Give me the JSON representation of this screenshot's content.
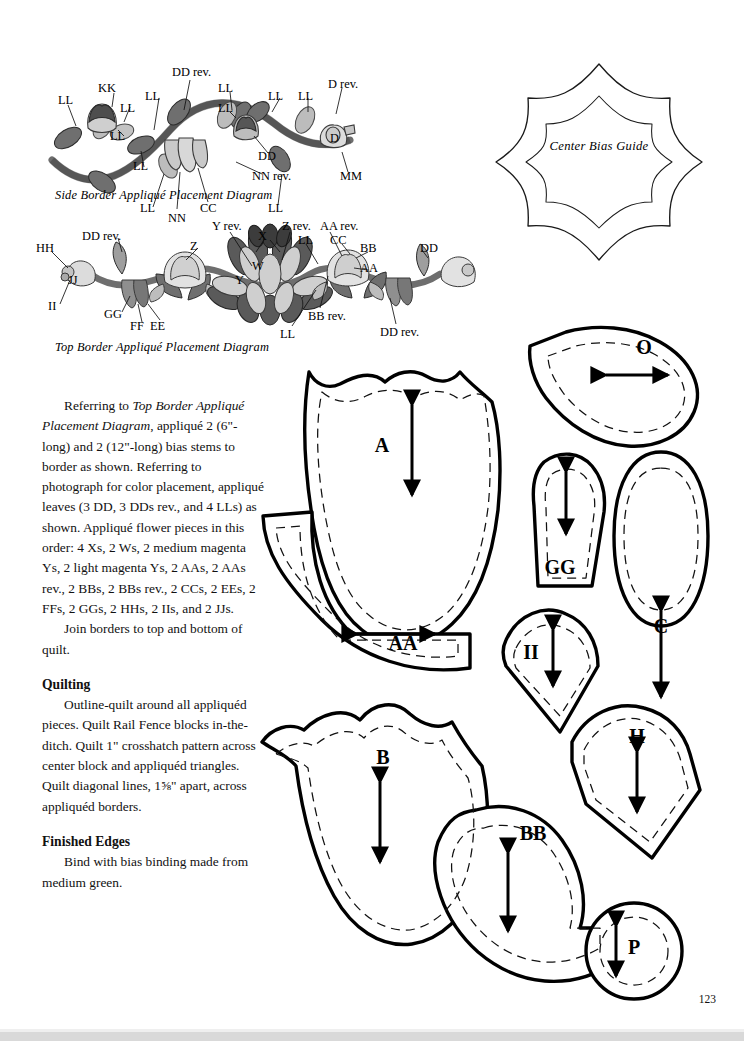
{
  "page": {
    "number": "123",
    "background": "#ffffff",
    "ink": "#000000"
  },
  "diagrams": {
    "side_border": {
      "caption": "Side Border Appliqué Placement Diagram",
      "labels": [
        {
          "text": "LL",
          "x": 18,
          "y": 42
        },
        {
          "text": "KK",
          "x": 58,
          "y": 30
        },
        {
          "text": "LL",
          "x": 80,
          "y": 50
        },
        {
          "text": "LL",
          "x": 70,
          "y": 78
        },
        {
          "text": "LL",
          "x": 105,
          "y": 38
        },
        {
          "text": "LL",
          "x": 93,
          "y": 108
        },
        {
          "text": "DD rev.",
          "x": 132,
          "y": 14
        },
        {
          "text": "LL",
          "x": 100,
          "y": 150
        },
        {
          "text": "NN",
          "x": 128,
          "y": 160
        },
        {
          "text": "CC",
          "x": 160,
          "y": 150
        },
        {
          "text": "LL",
          "x": 178,
          "y": 30
        },
        {
          "text": "LL",
          "x": 178,
          "y": 50
        },
        {
          "text": "DD",
          "x": 218,
          "y": 98
        },
        {
          "text": "NN rev.",
          "x": 212,
          "y": 118
        },
        {
          "text": "LL",
          "x": 228,
          "y": 38
        },
        {
          "text": "LL",
          "x": 258,
          "y": 38
        },
        {
          "text": "D rev.",
          "x": 288,
          "y": 26
        },
        {
          "text": "D",
          "x": 290,
          "y": 80
        },
        {
          "text": "MM",
          "x": 300,
          "y": 118
        },
        {
          "text": "LL",
          "x": 228,
          "y": 150
        }
      ]
    },
    "top_border": {
      "caption": "Top Border Appliqué Placement Diagram",
      "labels": [
        {
          "text": "HH",
          "x": 6,
          "y": 30
        },
        {
          "text": "JJ",
          "x": 38,
          "y": 62
        },
        {
          "text": "II",
          "x": 18,
          "y": 88
        },
        {
          "text": "DD rev.",
          "x": 52,
          "y": 18
        },
        {
          "text": "GG",
          "x": 74,
          "y": 96
        },
        {
          "text": "FF",
          "x": 100,
          "y": 108
        },
        {
          "text": "EE",
          "x": 120,
          "y": 108
        },
        {
          "text": "Z",
          "x": 160,
          "y": 28
        },
        {
          "text": "Y rev.",
          "x": 182,
          "y": 8
        },
        {
          "text": "X",
          "x": 228,
          "y": 18
        },
        {
          "text": "W",
          "x": 222,
          "y": 48
        },
        {
          "text": "Y",
          "x": 205,
          "y": 62
        },
        {
          "text": "Z rev.",
          "x": 252,
          "y": 8
        },
        {
          "text": "LL",
          "x": 268,
          "y": 22
        },
        {
          "text": "AA rev.",
          "x": 290,
          "y": 8
        },
        {
          "text": "CC",
          "x": 300,
          "y": 22
        },
        {
          "text": "BB",
          "x": 330,
          "y": 30
        },
        {
          "text": "AA",
          "x": 330,
          "y": 50
        },
        {
          "text": "BB rev.",
          "x": 278,
          "y": 98
        },
        {
          "text": "LL",
          "x": 250,
          "y": 116
        },
        {
          "text": "DD",
          "x": 390,
          "y": 30
        },
        {
          "text": "DD rev.",
          "x": 350,
          "y": 114
        }
      ]
    },
    "center_bias_guide": {
      "label": "Center Bias Guide"
    }
  },
  "body": {
    "p1_lead": "Referring to ",
    "p1_italic": "Top Border Appliqué Placement Diagram",
    "p1_rest": ", appliqué 2 (6\"-long) and 2 (12\"-long) bias stems to border as shown. Referring to photograph for color placement, appliqué leaves (3 DD, 3 DDs rev., and 4 LLs) as shown. Appliqué flower pieces in this order: 4 Xs, 2 Ws, 2 medium magenta Ys, 2 light magenta Ys, 2 AAs, 2 AAs rev., 2 BBs, 2 BBs rev., 2 CCs, 2 EEs, 2 FFs, 2 GGs, 2 HHs, 2 IIs, and 2 JJs.",
    "p2": "Join borders to top and bottom of quilt.",
    "h_quilting": "Quilting",
    "p3": "Outline-quilt around all appliquéd pieces. Quilt Rail Fence blocks in-the-ditch. Quilt 1\" crosshatch pattern across center block and appliquéd triangles. Quilt diagonal lines, 1⅝\" apart, across appliquéd borders.",
    "h_finished": "Finished Edges",
    "p4": "Bind with bias binding made from medium green."
  },
  "pattern_pieces": [
    {
      "id": "A",
      "label": "A",
      "grain": "vertical",
      "label_x": 382,
      "label_y": 452,
      "arrow_x": 412,
      "arrow_y": 450,
      "arrow_len": 90
    },
    {
      "id": "AA",
      "label": "AA",
      "grain": "horizontal",
      "label_x": 403,
      "label_y": 650,
      "arrow_x": 396,
      "arrow_y": 634,
      "arrow_len": 78
    },
    {
      "id": "B",
      "label": "B",
      "grain": "vertical",
      "label_x": 383,
      "label_y": 764,
      "arrow_x": 380,
      "arrow_y": 822,
      "arrow_len": 80
    },
    {
      "id": "BB",
      "label": "BB",
      "grain": "vertical",
      "label_x": 533,
      "label_y": 840,
      "arrow_x": 508,
      "arrow_y": 892,
      "arrow_len": 78
    },
    {
      "id": "O",
      "label": "O",
      "grain": "horizontal",
      "label_x": 644,
      "label_y": 354,
      "arrow_x": 637,
      "arrow_y": 375,
      "arrow_len": 62
    },
    {
      "id": "GG",
      "label": "GG",
      "grain": "vertical",
      "label_x": 560,
      "label_y": 574,
      "arrow_x": 566,
      "arrow_y": 503,
      "arrow_len": 62
    },
    {
      "id": "C",
      "label": "C",
      "grain": "vertical",
      "label_x": 661,
      "label_y": 633,
      "arrow_x": 661,
      "arrow_y": 654,
      "arrow_len": 86
    },
    {
      "id": "II",
      "label": "II",
      "grain": "vertical",
      "label_x": 531,
      "label_y": 659,
      "arrow_x": 553,
      "arrow_y": 658,
      "arrow_len": 56
    },
    {
      "id": "H",
      "label": "H",
      "grain": "vertical",
      "label_x": 637,
      "label_y": 743,
      "arrow_x": 637,
      "arrow_y": 782,
      "arrow_len": 60
    },
    {
      "id": "P",
      "label": "P",
      "grain": "vertical",
      "label_x": 634,
      "label_y": 954,
      "arrow_x": 616,
      "arrow_y": 951,
      "arrow_len": 50
    }
  ],
  "colors": {
    "outline": "#000000",
    "leaf_dark": "#6f6f6f",
    "leaf_light": "#b9b9b9",
    "leaf_mid": "#8f8f8f",
    "stem": "#7a7a7a",
    "flower_light": "#d5d5d5",
    "flower_dark": "#4a4a4a",
    "page_shadow": "#d9d9d9"
  }
}
